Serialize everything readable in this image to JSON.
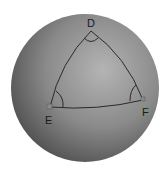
{
  "diagram": {
    "type": "spherical-triangle",
    "sphere": {
      "cx": 85,
      "cy": 88,
      "r": 74,
      "color_light": "#a8a8a8",
      "color_dark": "#505050"
    },
    "vertices": [
      {
        "id": "D",
        "label": "D",
        "x": 91,
        "y": 31,
        "label_x": 87,
        "label_y": 27
      },
      {
        "id": "E",
        "label": "E",
        "x": 50,
        "y": 107,
        "label_x": 45,
        "label_y": 124
      },
      {
        "id": "F",
        "label": "F",
        "x": 143,
        "y": 100,
        "label_x": 142,
        "label_y": 116
      }
    ],
    "edges": [
      {
        "from": "D",
        "to": "E"
      },
      {
        "from": "E",
        "to": "F"
      },
      {
        "from": "F",
        "to": "D"
      }
    ],
    "angle_marks": [
      "D",
      "E",
      "F"
    ],
    "line_color": "#2a2a2a"
  }
}
